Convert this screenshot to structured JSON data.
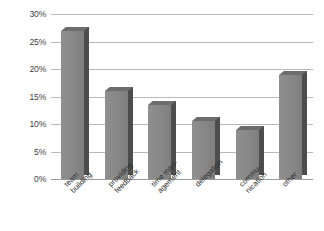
{
  "chart_data": {
    "type": "bar",
    "title": "",
    "subtitle": "",
    "xlabel": "",
    "ylabel": "",
    "categories": [
      "team building",
      "providing feedback",
      "time man-agement",
      "delegation",
      "commu-nication",
      "other"
    ],
    "category_lines": [
      [
        "team",
        "building"
      ],
      [
        "providing",
        "feedback"
      ],
      [
        "time man-",
        "agement"
      ],
      [
        "delegation"
      ],
      [
        "commu-",
        "nication"
      ],
      [
        "other"
      ]
    ],
    "values": [
      27,
      16,
      13.5,
      10.5,
      9,
      19
    ],
    "value_labels": [
      "27%",
      "16%",
      "13.5%",
      "10.5%",
      "9%",
      "19%"
    ],
    "ylim": [
      0,
      30
    ],
    "ytick_values": [
      0,
      5,
      10,
      15,
      20,
      25,
      30
    ],
    "ytick_labels": [
      "0%",
      "5%",
      "10%",
      "15%",
      "20%",
      "25%",
      "30%"
    ],
    "grid": true,
    "legend": false,
    "legend_position": "none",
    "bar_style": "3d",
    "colors": {
      "bar_face": "#8a8a8a",
      "bar_side": "#4d4d4d",
      "bar_top": "#6d6d6d",
      "gridline": "#b9b9b9",
      "axis": "#9a9a9a",
      "text": "#2e2e2e",
      "background": "#ffffff"
    }
  }
}
